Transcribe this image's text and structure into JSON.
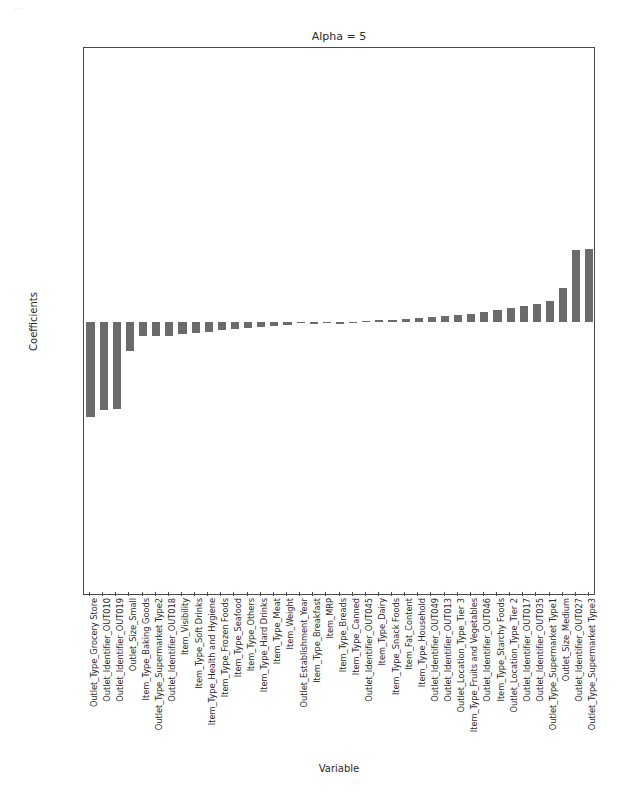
{
  "figure": {
    "title": "Alpha = 5",
    "xlabel": "Variable",
    "ylabel": "Coefficients",
    "bar_color": "#6b6b6b",
    "frame_color": "#4a4a4a",
    "scan_artifact": "..."
  },
  "chart_data": {
    "type": "bar",
    "title": "Alpha = 5",
    "xlabel": "Variable",
    "ylabel": "Coefficients",
    "ylim": [
      -800,
      800
    ],
    "yticks": [
      800,
      600,
      400,
      200,
      0,
      -200,
      -400,
      -600,
      -800
    ],
    "grid": false,
    "legend": null,
    "orientation": "vertical",
    "categories": [
      "Outlet_Type_Grocery Store",
      "Outlet_Identifier_OUT010",
      "Outlet_Identifier_OUT019",
      "Outlet_Size_Small",
      "Item_Type_Baking Goods",
      "Outlet_Type_Supermarket Type2",
      "Outlet_Identifier_OUT018",
      "Item_Visibility",
      "Item_Type_Soft Drinks",
      "Item_Type_Health and Hygiene",
      "Item_Type_Frozen Foods",
      "Item_Type_Seafood",
      "Item_Type_Others",
      "Item_Type_Hard Drinks",
      "Item_Type_Meat",
      "Item_Weight",
      "Outlet_Establishment_Year",
      "Item_Type_Breakfast",
      "Item_MRP",
      "Item_Type_Breads",
      "Item_Type_Canned",
      "Outlet_Identifier_OUT045",
      "Item_Type_Dairy",
      "Item_Type_Snack Foods",
      "Item_Fat_Content",
      "Item_Type_Household",
      "Outlet_Identifier_OUT049",
      "Outlet_Identifier_OUT013",
      "Outlet_Location_Type_Tier 3",
      "Item_Type_Fruits and Vegetables",
      "Outlet_Identifier_OUT046",
      "Item_Type_Starchy Foods",
      "Outlet_Location_Type_Tier 2",
      "Outlet_Identifier_OUT017",
      "Outlet_Identifier_OUT035",
      "Outlet_Type_Supermarket Type1",
      "Outlet_Size_Medium",
      "Outlet_Identifier_OUT027",
      "Outlet_Type_Supermarket Type3"
    ],
    "values": [
      -278,
      -258,
      -255,
      -85,
      -42,
      -40,
      -40,
      -34,
      -31,
      -28,
      -24,
      -21,
      -18,
      -15,
      -12,
      -9,
      0,
      -7,
      0,
      -6,
      -4,
      4,
      6,
      7,
      9,
      11,
      14,
      17,
      20,
      24,
      28,
      34,
      40,
      47,
      54,
      62,
      100,
      210,
      212
    ]
  }
}
